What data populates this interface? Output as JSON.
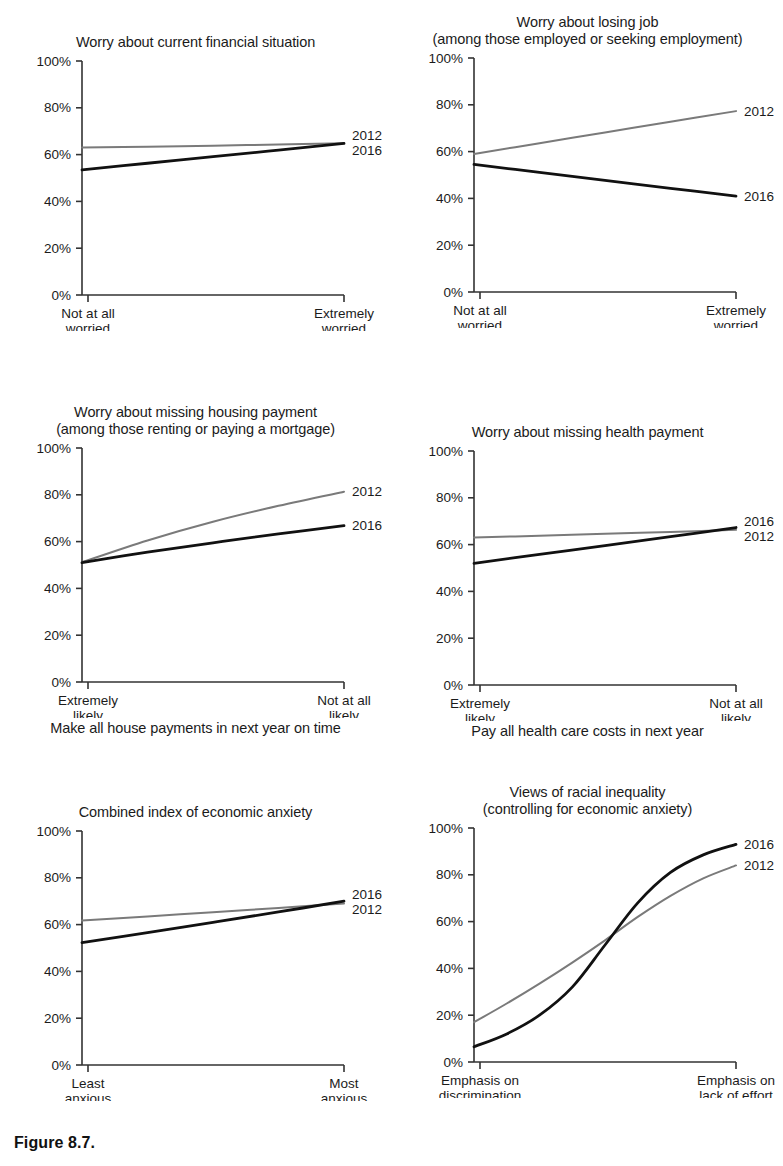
{
  "figure": {
    "caption": "Figure 8.7.",
    "y_ticks": [
      "0%",
      "20%",
      "40%",
      "60%",
      "80%",
      "100%"
    ],
    "series_names": [
      "2012",
      "2016"
    ],
    "colors": {
      "series_2012": "#7a7a7a",
      "series_2016": "#111111",
      "axis": "#333333",
      "text": "#1b1b1b",
      "background": "#ffffff"
    }
  },
  "panels": [
    {
      "id": "worry-current-financial-situation",
      "title": "Worry about current financial situation",
      "title_line1": "Worry about current financial situation",
      "title_line2": "",
      "x_left_label": "Not at all\nworried",
      "x_right_label": "Extremely\nworried",
      "footer": "",
      "label_2012": "2012",
      "label_2016": "2016"
    },
    {
      "id": "worry-losing-job",
      "title": "Worry about losing job (among those employed or seeking employment)",
      "title_line1": "Worry about losing job",
      "title_line2": "(among those employed or seeking employment)",
      "x_left_label": "Not at all\nworried",
      "x_right_label": "Extremely\nworried",
      "footer": "",
      "label_2012": "2012",
      "label_2016": "2016"
    },
    {
      "id": "worry-missing-housing-payment",
      "title": "Worry about missing housing payment (among those renting or paying a mortgage)",
      "title_line1": "Worry about missing housing payment",
      "title_line2": "(among those renting or paying a mortgage)",
      "x_left_label": "Extremely\nlikely",
      "x_right_label": "Not at all\nlikely",
      "footer": "Make all house payments in next year on time",
      "label_2012": "2012",
      "label_2016": "2016"
    },
    {
      "id": "worry-missing-health-payment",
      "title": "Worry about missing health payment",
      "title_line1": "Worry about missing health payment",
      "title_line2": "",
      "x_left_label": "Extremely\nlikely",
      "x_right_label": "Not at all\nlikely",
      "footer": "Pay all health care costs in next year",
      "label_2012": "2012",
      "label_2016": "2016"
    },
    {
      "id": "combined-index-economic-anxiety",
      "title": "Combined index of economic anxiety",
      "title_line1": "Combined index of economic anxiety",
      "title_line2": "",
      "x_left_label": "Least\nanxious",
      "x_right_label": "Most\nanxious",
      "footer": "",
      "label_2012": "2012",
      "label_2016": "2016"
    },
    {
      "id": "views-of-racial-inequality",
      "title": "Views of racial inequality (controlling for economic anxiety)",
      "title_line1": "Views of racial inequality",
      "title_line2": "(controlling for economic anxiety)",
      "x_left_label": "Emphasis on\ndiscrimination",
      "x_right_label": "Emphasis on\nlack of effort",
      "footer": "",
      "label_2012": "2012",
      "label_2016": "2016"
    }
  ],
  "chart_data": [
    {
      "type": "line",
      "title": "Worry about current financial situation",
      "xlabel": "",
      "ylabel": "",
      "ylim": [
        0,
        100
      ],
      "xlim": [
        0,
        1
      ],
      "grid": false,
      "legend_position": "right-of-line-end",
      "xtick_labels": [
        "Not at all worried",
        "Extremely worried"
      ],
      "ytick_labels": [
        "0%",
        "20%",
        "40%",
        "60%",
        "80%",
        "100%"
      ],
      "x": [
        0,
        0.25,
        0.5,
        0.75,
        1
      ],
      "series": [
        {
          "name": "2012",
          "values": [
            63.0,
            63.4,
            63.8,
            64.3,
            64.8
          ]
        },
        {
          "name": "2016",
          "values": [
            53.5,
            56.3,
            59.1,
            61.9,
            64.8
          ]
        }
      ]
    },
    {
      "type": "line",
      "title": "Worry about losing job (among those employed or seeking employment)",
      "xlabel": "",
      "ylabel": "",
      "ylim": [
        0,
        100
      ],
      "xlim": [
        0,
        1
      ],
      "grid": false,
      "legend_position": "right-of-line-end",
      "xtick_labels": [
        "Not at all worried",
        "Extremely worried"
      ],
      "ytick_labels": [
        "0%",
        "20%",
        "40%",
        "60%",
        "80%",
        "100%"
      ],
      "x": [
        0,
        0.25,
        0.5,
        0.75,
        1
      ],
      "series": [
        {
          "name": "2012",
          "values": [
            59.0,
            63.6,
            68.2,
            72.8,
            77.3
          ]
        },
        {
          "name": "2016",
          "values": [
            54.5,
            51.1,
            47.7,
            44.3,
            41.0
          ]
        }
      ]
    },
    {
      "type": "line",
      "title": "Worry about missing housing payment (among those renting or paying a mortgage)",
      "xlabel": "Make all house payments in next year on time",
      "ylabel": "",
      "ylim": [
        0,
        100
      ],
      "xlim": [
        0,
        1
      ],
      "grid": false,
      "legend_position": "right-of-line-end",
      "xtick_labels": [
        "Extremely likely",
        "Not at all likely"
      ],
      "ytick_labels": [
        "0%",
        "20%",
        "40%",
        "60%",
        "80%",
        "100%"
      ],
      "x": [
        0,
        0.25,
        0.5,
        0.75,
        1
      ],
      "series": [
        {
          "name": "2012",
          "values": [
            51.2,
            60.5,
            68.5,
            75.3,
            81.3
          ]
        },
        {
          "name": "2016",
          "values": [
            51.0,
            55.5,
            59.5,
            63.3,
            66.8
          ]
        }
      ]
    },
    {
      "type": "line",
      "title": "Worry about missing health payment",
      "xlabel": "Pay all health care costs in next year",
      "ylabel": "",
      "ylim": [
        0,
        100
      ],
      "xlim": [
        0,
        1
      ],
      "grid": false,
      "legend_position": "right-of-line-end",
      "xtick_labels": [
        "Extremely likely",
        "Not at all likely"
      ],
      "ytick_labels": [
        "0%",
        "20%",
        "40%",
        "60%",
        "80%",
        "100%"
      ],
      "x": [
        0,
        0.25,
        0.5,
        0.75,
        1
      ],
      "series": [
        {
          "name": "2012",
          "values": [
            63.0,
            63.8,
            64.6,
            65.4,
            66.3
          ]
        },
        {
          "name": "2016",
          "values": [
            52.0,
            55.8,
            59.6,
            63.4,
            67.3
          ]
        }
      ]
    },
    {
      "type": "line",
      "title": "Combined index of economic anxiety",
      "xlabel": "",
      "ylabel": "",
      "ylim": [
        0,
        100
      ],
      "xlim": [
        0,
        1
      ],
      "grid": false,
      "legend_position": "right-of-line-end",
      "xtick_labels": [
        "Least anxious",
        "Most anxious"
      ],
      "ytick_labels": [
        "0%",
        "20%",
        "40%",
        "60%",
        "80%",
        "100%"
      ],
      "x": [
        0,
        0.25,
        0.5,
        0.75,
        1
      ],
      "series": [
        {
          "name": "2012",
          "values": [
            61.7,
            63.5,
            65.3,
            67.1,
            69.0
          ]
        },
        {
          "name": "2016",
          "values": [
            52.3,
            56.6,
            61.0,
            65.4,
            70.0
          ]
        }
      ]
    },
    {
      "type": "line",
      "title": "Views of racial inequality (controlling for economic anxiety)",
      "xlabel": "",
      "ylabel": "",
      "ylim": [
        0,
        100
      ],
      "xlim": [
        0,
        1
      ],
      "grid": false,
      "legend_position": "right-of-line-end",
      "xtick_labels": [
        "Emphasis on discrimination",
        "Emphasis on lack of effort"
      ],
      "ytick_labels": [
        "0%",
        "20%",
        "40%",
        "60%",
        "80%",
        "100%"
      ],
      "x": [
        0,
        0.125,
        0.25,
        0.375,
        0.5,
        0.625,
        0.75,
        0.875,
        1
      ],
      "series": [
        {
          "name": "2012",
          "values": [
            17.0,
            25.0,
            33.5,
            42.5,
            52.0,
            62.0,
            71.0,
            78.5,
            84.0
          ]
        },
        {
          "name": "2016",
          "values": [
            6.5,
            12.0,
            20.0,
            32.0,
            50.0,
            68.0,
            81.0,
            88.5,
            93.0
          ]
        }
      ]
    }
  ]
}
